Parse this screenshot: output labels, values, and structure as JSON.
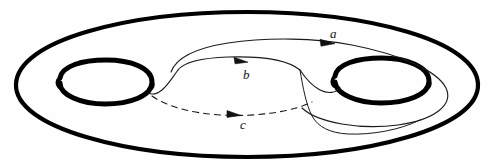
{
  "figure": {
    "name": "genus-two-surface-with-curves",
    "background_color": "#fefefe",
    "ink_color": "#111111",
    "thick_stroke_color": "#000000"
  },
  "labels": {
    "a": "a",
    "b": "b",
    "c": "c"
  },
  "curves": [
    {
      "id": "a",
      "label": "a",
      "style": "solid",
      "stroke_width": 1,
      "color": "#111111",
      "oriented": true,
      "arrow_direction": "right",
      "visible": true,
      "description": "Long thin loop running over the top of the surface and wrapping around the right handle"
    },
    {
      "id": "b",
      "label": "b",
      "style": "solid",
      "stroke_width": 1,
      "color": "#111111",
      "oriented": true,
      "arrow_direction": "right",
      "visible": true,
      "description": "Thin curve arcing across the middle of the surface between the two holes forming the top of the tube"
    },
    {
      "id": "c",
      "label": "c",
      "style": "dashed",
      "stroke_width": 1,
      "color": "#111111",
      "oriented": true,
      "arrow_direction": "right",
      "visible": true,
      "description": "Dashed (hidden) curve passing beneath the surface between the two holes"
    }
  ],
  "holes": [
    {
      "id": "left-hole",
      "cx": 104,
      "cy": 82,
      "rx": 48,
      "ry": 22,
      "stroke_width": 5
    },
    {
      "id": "right-hole",
      "cx": 381,
      "cy": 80,
      "rx": 48,
      "ry": 22,
      "stroke_width": 5
    }
  ],
  "outline": {
    "id": "outer-boundary",
    "cx": 247,
    "cy": 84,
    "rx": 232,
    "ry": 72,
    "stroke_width": 4
  }
}
